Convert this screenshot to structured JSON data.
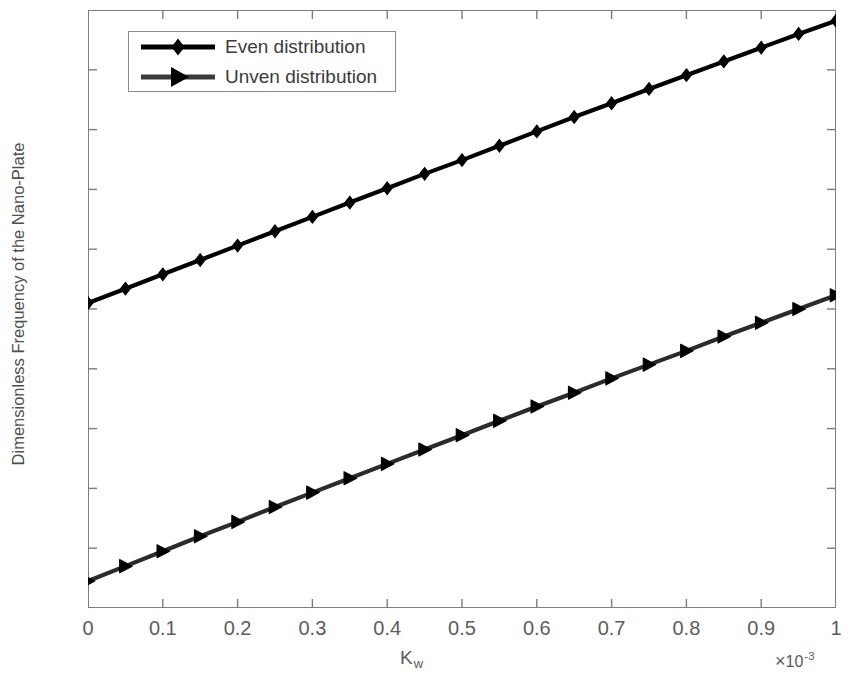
{
  "chart_data": {
    "type": "line",
    "title": "",
    "xlabel": "K_w",
    "xlabel_base": "K",
    "xlabel_sub": "w",
    "ylabel": "Dimensionless Frequency of the Nano-Plate",
    "x_multiplier_symbol": "×",
    "x_multiplier_mantissa": "10",
    "x_multiplier_exponent": "-3",
    "xlim": [
      0,
      1
    ],
    "ylim": [
      0.32,
      0.42
    ],
    "xticks": [
      0,
      0.1,
      0.2,
      0.3,
      0.4,
      0.5,
      0.6,
      0.7,
      0.8,
      0.9,
      1
    ],
    "xticklabels": [
      "0",
      "0.1",
      "0.2",
      "0.3",
      "0.4",
      "0.5",
      "0.6",
      "0.7",
      "0.8",
      "0.9",
      "1"
    ],
    "yticks": [
      0.32,
      0.33,
      0.34,
      0.35,
      0.36,
      0.37,
      0.38,
      0.39,
      0.4,
      0.41,
      0.42
    ],
    "yticklabels": [
      "0.32",
      "0.33",
      "0.34",
      "0.35",
      "0.36",
      "0.37",
      "0.38",
      "0.39",
      "0.4",
      "0.41",
      "0.42"
    ],
    "grid": false,
    "legend_position": "upper-left",
    "x": [
      0,
      0.05,
      0.1,
      0.15,
      0.2,
      0.25,
      0.3,
      0.35,
      0.4,
      0.45,
      0.5,
      0.55,
      0.6,
      0.65,
      0.7,
      0.75,
      0.8,
      0.85,
      0.9,
      0.95,
      1
    ],
    "series": [
      {
        "name": "Even distribution",
        "marker": "diamond",
        "color": "#000000",
        "values": [
          0.371,
          0.3734,
          0.3758,
          0.3782,
          0.3806,
          0.383,
          0.3854,
          0.3878,
          0.3902,
          0.3926,
          0.3949,
          0.3973,
          0.3997,
          0.4021,
          0.4044,
          0.4068,
          0.4091,
          0.4114,
          0.4137,
          0.416,
          0.4182
        ]
      },
      {
        "name": "Unven distribution",
        "marker": "right-triangle",
        "color": "#2b2b2b",
        "values": [
          0.3245,
          0.327,
          0.3295,
          0.332,
          0.3344,
          0.3369,
          0.3393,
          0.3417,
          0.3441,
          0.3465,
          0.3489,
          0.3513,
          0.3537,
          0.356,
          0.3584,
          0.3607,
          0.363,
          0.3654,
          0.3677,
          0.37,
          0.3723
        ]
      }
    ]
  },
  "legend": {
    "items": [
      {
        "label": "Even distribution"
      },
      {
        "label": "Unven distribution"
      }
    ]
  }
}
